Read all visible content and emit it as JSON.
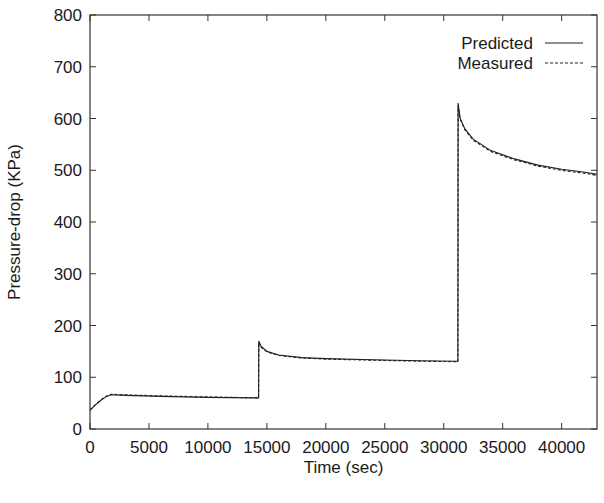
{
  "chart_data": {
    "type": "line",
    "title": "",
    "xlabel": "Time (sec)",
    "ylabel": "Pressure-drop (KPa)",
    "xlim": [
      0,
      43000
    ],
    "ylim": [
      0,
      800
    ],
    "x_ticks": [
      0,
      5000,
      10000,
      15000,
      20000,
      25000,
      30000,
      35000,
      40000
    ],
    "x_tick_labels": [
      "0",
      "5000",
      "10000",
      "15000",
      "20000",
      "25000",
      "30000",
      "35000",
      "40000"
    ],
    "y_ticks": [
      0,
      100,
      200,
      300,
      400,
      500,
      600,
      700,
      800
    ],
    "y_tick_labels": [
      "0",
      "100",
      "200",
      "300",
      "400",
      "500",
      "600",
      "700",
      "800"
    ],
    "grid": false,
    "legend_position": "upper right",
    "series": [
      {
        "name": "Predicted",
        "style": "solid",
        "color": "#222222",
        "x": [
          0,
          400,
          900,
          1400,
          1800,
          3000,
          6000,
          10000,
          14300,
          14320,
          14500,
          15000,
          16000,
          18000,
          20000,
          24000,
          28000,
          31200,
          31220,
          31400,
          31800,
          32500,
          34000,
          36000,
          38000,
          40000,
          42000,
          43000
        ],
        "y": [
          36,
          45,
          55,
          63,
          66,
          65,
          63,
          61,
          60,
          170,
          160,
          150,
          143,
          138,
          136,
          134,
          132,
          131,
          630,
          600,
          580,
          560,
          538,
          522,
          510,
          502,
          496,
          492
        ]
      },
      {
        "name": "Measured",
        "style": "dashed",
        "color": "#222222",
        "x": [
          0,
          400,
          900,
          1400,
          1800,
          3000,
          6000,
          10000,
          14300,
          14320,
          14500,
          15000,
          16000,
          18000,
          20000,
          24000,
          28000,
          31200,
          31220,
          31400,
          31800,
          32500,
          34000,
          36000,
          38000,
          40000,
          42000,
          43000
        ],
        "y": [
          37,
          46,
          56,
          64,
          67,
          66,
          64,
          62,
          60,
          168,
          158,
          149,
          142,
          137,
          135,
          133,
          131,
          130,
          625,
          598,
          578,
          558,
          536,
          520,
          508,
          500,
          494,
          490
        ]
      }
    ]
  },
  "legend": {
    "items": [
      {
        "label": "Predicted",
        "style": "solid"
      },
      {
        "label": "Measured",
        "style": "dashed"
      }
    ]
  },
  "axes": {
    "xlabel": "Time (sec)",
    "ylabel": "Pressure-drop (KPa)"
  }
}
